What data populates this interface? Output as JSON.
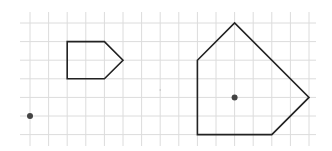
{
  "diagram": {
    "type": "grid-geometry",
    "grid": {
      "columns": 16,
      "rows": 7,
      "color": "#dcdcdc"
    },
    "shapes": [
      {
        "name": "small-pentagon",
        "vertices_grid": [
          [
            2,
            1
          ],
          [
            4,
            1
          ],
          [
            5,
            2
          ],
          [
            4,
            3
          ],
          [
            2,
            3
          ]
        ],
        "stroke": "#222222"
      },
      {
        "name": "large-pentagon",
        "vertices_grid": [
          [
            9,
            2
          ],
          [
            11,
            0
          ],
          [
            15,
            4
          ],
          [
            13,
            6
          ],
          [
            9,
            6
          ]
        ],
        "stroke": "#222222"
      }
    ],
    "points": [
      {
        "name": "center-point-left",
        "grid": [
          0,
          5
        ],
        "color": "#444444"
      },
      {
        "name": "center-point-right",
        "grid": [
          11,
          4
        ],
        "color": "#444444"
      }
    ],
    "marks": [
      {
        "name": "faint-mark",
        "grid": [
          7,
          3.6
        ],
        "color": "#bdbdbd"
      }
    ]
  }
}
